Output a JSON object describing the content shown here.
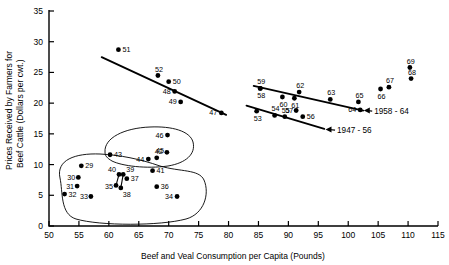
{
  "chart_data": {
    "type": "scatter",
    "title": "",
    "xlabel": "Beef and Veal Consumption per Capita (Pounds)",
    "ylabel": "Prices Received by Farmers for Beef Cattle (Dollars per cwt.)",
    "ylabel_line1": "Prices Received by Farmers for",
    "ylabel_line2": "Beef Cattle (Dollars per cwt.)",
    "xlim": [
      50,
      115
    ],
    "ylim": [
      0,
      35
    ],
    "xticks": [
      50,
      55,
      60,
      65,
      70,
      75,
      80,
      85,
      90,
      95,
      100,
      105,
      110,
      115
    ],
    "yticks": [
      0,
      5,
      10,
      15,
      20,
      25,
      30,
      35
    ],
    "grid": false,
    "legend": "none",
    "point_label_field": "year (last two digits)",
    "points": [
      {
        "label": "29",
        "x": 55.4,
        "y": 9.8,
        "lx": 4,
        "ly": 2.5
      },
      {
        "label": "30",
        "x": 54.9,
        "y": 7.9,
        "lx": -11,
        "ly": 2.5
      },
      {
        "label": "31",
        "x": 54.7,
        "y": 6.5,
        "lx": -11,
        "ly": 2.5
      },
      {
        "label": "32",
        "x": 52.6,
        "y": 5.2,
        "lx": 4,
        "ly": 3.0
      },
      {
        "label": "33",
        "x": 57.0,
        "y": 4.8,
        "lx": -11,
        "ly": 2.5
      },
      {
        "label": "34",
        "x": 71.4,
        "y": 4.8,
        "lx": -12,
        "ly": 2.5
      },
      {
        "label": "35",
        "x": 61.2,
        "y": 6.6,
        "lx": -11,
        "ly": 3.5
      },
      {
        "label": "36",
        "x": 68.0,
        "y": 6.4,
        "lx": 4,
        "ly": 2.5
      },
      {
        "label": "37",
        "x": 63.0,
        "y": 7.7,
        "lx": 4,
        "ly": 2.5
      },
      {
        "label": "38",
        "x": 62.0,
        "y": 6.2,
        "lx": 2,
        "ly": 9.0
      },
      {
        "label": "39",
        "x": 62.4,
        "y": 8.4,
        "lx": 3,
        "ly": -2.5
      },
      {
        "label": "40",
        "x": 61.7,
        "y": 8.4,
        "lx": -11,
        "ly": -2.5
      },
      {
        "label": "41",
        "x": 67.3,
        "y": 9.0,
        "lx": 4,
        "ly": 2.5
      },
      {
        "label": "42",
        "x": 68.0,
        "y": 11.1,
        "lx": -2,
        "ly": -4.0
      },
      {
        "label": "43",
        "x": 60.2,
        "y": 11.6,
        "lx": 4,
        "ly": 2.5
      },
      {
        "label": "44",
        "x": 66.6,
        "y": 10.9,
        "lx": -12,
        "ly": 2.5
      },
      {
        "label": "45",
        "x": 69.7,
        "y": 12.0,
        "lx": -11,
        "ly": 0.5
      },
      {
        "label": "46",
        "x": 69.8,
        "y": 14.8,
        "lx": -12,
        "ly": 2.5
      },
      {
        "label": "47",
        "x": 78.8,
        "y": 18.4,
        "lx": -12,
        "ly": 2.5
      },
      {
        "label": "48",
        "x": 71.0,
        "y": 21.9,
        "lx": -12,
        "ly": 2.5
      },
      {
        "label": "49",
        "x": 72.0,
        "y": 20.2,
        "lx": -12,
        "ly": 2.5
      },
      {
        "label": "50",
        "x": 70.0,
        "y": 23.5,
        "lx": 4,
        "ly": 2.5
      },
      {
        "label": "51",
        "x": 61.6,
        "y": 28.7,
        "lx": 4,
        "ly": 2.5
      },
      {
        "label": "52",
        "x": 68.2,
        "y": 24.5,
        "lx": -3,
        "ly": -4.0
      },
      {
        "label": "53",
        "x": 84.7,
        "y": 18.7,
        "lx": -3,
        "ly": 9.5
      },
      {
        "label": "54",
        "x": 87.7,
        "y": 18.0,
        "lx": -3,
        "ly": -4.0
      },
      {
        "label": "55",
        "x": 89.4,
        "y": 17.8,
        "lx": -3,
        "ly": -4.0
      },
      {
        "label": "56",
        "x": 92.4,
        "y": 17.8,
        "lx": 4,
        "ly": 2.5
      },
      {
        "label": "57",
        "x": 91.3,
        "y": 18.8,
        "lx": -11,
        "ly": 2.5
      },
      {
        "label": "58",
        "x": 85.3,
        "y": 22.4,
        "lx": -3,
        "ly": 9.5
      },
      {
        "label": "59",
        "x": 85.3,
        "y": 22.4,
        "lx": -3,
        "ly": -4.0
      },
      {
        "label": "60",
        "x": 89.0,
        "y": 21.0,
        "lx": -3,
        "ly": 9.5
      },
      {
        "label": "61",
        "x": 91.0,
        "y": 20.8,
        "lx": -3,
        "ly": 9.5
      },
      {
        "label": "62",
        "x": 91.8,
        "y": 21.8,
        "lx": -3,
        "ly": -4.0
      },
      {
        "label": "63",
        "x": 97.0,
        "y": 20.6,
        "lx": -3,
        "ly": -4.0
      },
      {
        "label": "64",
        "x": 102.0,
        "y": 18.9,
        "lx": -12,
        "ly": 2.5
      },
      {
        "label": "65",
        "x": 101.7,
        "y": 20.2,
        "lx": -3,
        "ly": -4.0
      },
      {
        "label": "66",
        "x": 105.4,
        "y": 22.3,
        "lx": -3,
        "ly": 9.5
      },
      {
        "label": "67",
        "x": 106.8,
        "y": 22.6,
        "lx": -3,
        "ly": -4.0
      },
      {
        "label": "68",
        "x": 110.5,
        "y": 24.0,
        "lx": -3,
        "ly": -4.0
      },
      {
        "label": "69",
        "x": 110.3,
        "y": 25.8,
        "lx": -3,
        "ly": -4.0
      }
    ],
    "trend_lines": [
      {
        "name": "1947-52 upper",
        "x1": 58.8,
        "y1": 27.5,
        "x2": 79.6,
        "y2": 18.1
      },
      {
        "name": "1947-56 lower",
        "x1": 83.0,
        "y1": 19.6,
        "x2": 96.0,
        "y2": 15.8
      },
      {
        "name": "1958-64",
        "x1": 84.2,
        "y1": 22.8,
        "x2": 102.5,
        "y2": 18.8
      }
    ],
    "annotations": [
      {
        "text": "1958 - 64",
        "x": 104.0,
        "y": 18.7,
        "arrow_to_x": 102.6,
        "arrow_to_y": 18.8
      },
      {
        "text": "1947 - 56",
        "x": 97.8,
        "y": 15.6,
        "arrow_to_x": 96.2,
        "arrow_to_y": 15.7
      }
    ],
    "envelopes": [
      {
        "name": "lower-cluster-envelope",
        "description": "closed curve enclosing points 29-41 and 34, 36"
      },
      {
        "name": "upper-cluster-envelope",
        "description": "closed curve enclosing points 43, 44, 42, 45, 46"
      }
    ]
  }
}
